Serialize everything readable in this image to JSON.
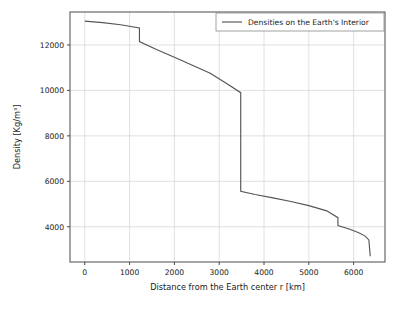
{
  "chart_data": {
    "type": "line",
    "title": "",
    "xlabel": "Distance from the Earth center r [km]",
    "ylabel": "Density [Kg/m³]",
    "xlim": [
      -330,
      6700
    ],
    "ylim": [
      2450,
      13450
    ],
    "xticks": [
      0,
      1000,
      2000,
      3000,
      4000,
      5000,
      6000
    ],
    "xtick_labels": [
      "0",
      "1000",
      "2000",
      "3000",
      "4000",
      "5000",
      "6000"
    ],
    "yticks": [
      4000,
      6000,
      8000,
      10000,
      12000
    ],
    "ytick_labels": [
      "4000",
      "6000",
      "8000",
      "10000",
      "12000"
    ],
    "grid": true,
    "legend_position": "upper right",
    "legend_entries": [
      "Densities on the Earth's Interior"
    ],
    "line_color": "#555555",
    "grid_color": "#d8d8d8",
    "axes_color": "#4a4a4a",
    "background_color": "#ffffff",
    "series": [
      {
        "name": "Densities on the Earth's Interior",
        "x": [
          0,
          400,
          800,
          1220,
          1220,
          1600,
          2000,
          2400,
          2800,
          3200,
          3480,
          3480,
          3800,
          4200,
          4600,
          5000,
          5400,
          5650,
          5650,
          5900,
          6100,
          6250,
          6340,
          6340,
          6371
        ],
        "y": [
          13050,
          12980,
          12890,
          12750,
          12150,
          11800,
          11460,
          11110,
          10760,
          10260,
          9900,
          5560,
          5420,
          5270,
          5110,
          4930,
          4700,
          4400,
          4050,
          3900,
          3750,
          3600,
          3420,
          3420,
          2700
        ]
      }
    ]
  },
  "axis": {
    "xlabel": "Distance from the Earth center r [km]",
    "ylabel": "Density [Kg/m³]"
  },
  "legend": {
    "entry_label": "Densities on the Earth's Interior"
  },
  "ticks": {
    "x": [
      "0",
      "1000",
      "2000",
      "3000",
      "4000",
      "5000",
      "6000"
    ],
    "y": [
      "4000",
      "6000",
      "8000",
      "10000",
      "12000"
    ]
  }
}
